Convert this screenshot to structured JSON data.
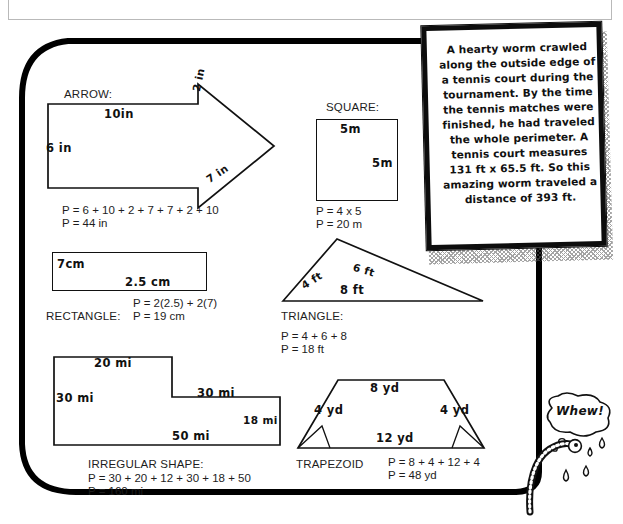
{
  "page": {
    "background_color": "#ffffff",
    "ink_color": "#111111",
    "frame_color": "#000000"
  },
  "shapes": {
    "arrow": {
      "title": "ARROW:",
      "dims": {
        "top": "10in",
        "left": "6 in",
        "head_top": "2 in",
        "head_bottom": "7 in"
      },
      "perimeter_expr": "P = 6 + 10 + 2 + 7 + 7 + 2 + 10",
      "perimeter_value": "P = 44 in"
    },
    "square": {
      "title": "SQUARE:",
      "dims": {
        "top": "5m",
        "right": "5m"
      },
      "perimeter_expr": "P = 4 x 5",
      "perimeter_value": "P = 20 m"
    },
    "rectangle": {
      "title": "RECTANGLE:",
      "dims": {
        "left": "7cm",
        "bottom": "2.5 cm"
      },
      "perimeter_expr": "P = 2(2.5) + 2(7)",
      "perimeter_value": "P = 19 cm"
    },
    "triangle": {
      "title": "TRIANGLE:",
      "dims": {
        "left_side": "4 ft",
        "right_side": "6 ft",
        "base": "8 ft"
      },
      "perimeter_expr": "P = 4 + 6 + 8",
      "perimeter_value": "P = 18 ft"
    },
    "irregular": {
      "title": "IRREGULAR SHAPE:",
      "dims": {
        "top": "20 mi",
        "left": "30 mi",
        "middle": "30 mi",
        "right": "18 mi",
        "bottom": "50 mi"
      },
      "perimeter_expr": "P = 30 + 20 + 12 + 30 + 18 + 50",
      "perimeter_value": "P = 160 mi"
    },
    "trapezoid": {
      "title": "TRAPEZOID",
      "dims": {
        "top": "8 yd",
        "left_side": "4 yd",
        "right_side": "4 yd",
        "bottom": "12 yd"
      },
      "perimeter_expr": "P = 8 + 4 + 12 + 4",
      "perimeter_value": "P = 48 yd"
    }
  },
  "note": {
    "text": "A hearty worm crawled along the outside edge of a tennis court during the tournament. By the time the tennis matches were finished, he had traveled the whole perimeter. A tennis court measures 131 ft x 65.5 ft. So this amazing worm traveled a distance of 393 ft."
  },
  "worm": {
    "speech": "Whew!"
  }
}
